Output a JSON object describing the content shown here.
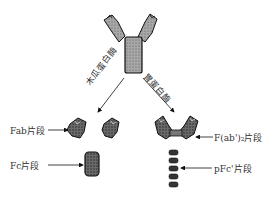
{
  "diagram": {
    "title": "",
    "enzymes": {
      "left": "木瓜蛋白酶",
      "right": "胃蛋白酶"
    },
    "labels": {
      "fab": "Fab片段",
      "fc": "Fc片段",
      "fab2": "F(ab')₂片段",
      "pfc": "pFc'片段"
    },
    "colors": {
      "fill": "#8a8a8a",
      "dark_fill": "#4a4a4a",
      "stroke": "#111111"
    }
  }
}
